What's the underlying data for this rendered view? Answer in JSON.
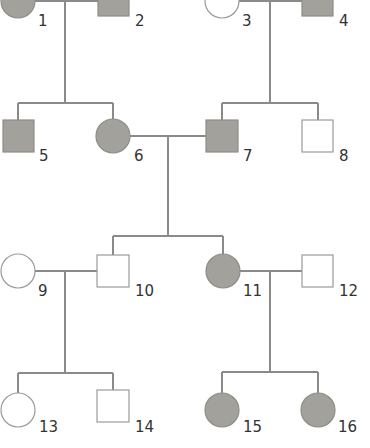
{
  "diagram": {
    "type": "pedigree",
    "colors": {
      "affected": "#a3a19b",
      "unaffected": "#ffffff",
      "line": "#8a8a8a",
      "label": "#333333"
    },
    "individuals": [
      {
        "id": "1",
        "label": "1",
        "sex": "female",
        "affected": true,
        "generation": 1
      },
      {
        "id": "2",
        "label": "2",
        "sex": "male",
        "affected": true,
        "generation": 1
      },
      {
        "id": "3",
        "label": "3",
        "sex": "female",
        "affected": false,
        "generation": 1
      },
      {
        "id": "4",
        "label": "4",
        "sex": "male",
        "affected": true,
        "generation": 1
      },
      {
        "id": "5",
        "label": "5",
        "sex": "male",
        "affected": true,
        "generation": 2
      },
      {
        "id": "6",
        "label": "6",
        "sex": "female",
        "affected": true,
        "generation": 2
      },
      {
        "id": "7",
        "label": "7",
        "sex": "male",
        "affected": true,
        "generation": 2
      },
      {
        "id": "8",
        "label": "8",
        "sex": "male",
        "affected": false,
        "generation": 2
      },
      {
        "id": "9",
        "label": "9",
        "sex": "female",
        "affected": false,
        "generation": 3
      },
      {
        "id": "10",
        "label": "10",
        "sex": "male",
        "affected": false,
        "generation": 3
      },
      {
        "id": "11",
        "label": "11",
        "sex": "female",
        "affected": true,
        "generation": 3
      },
      {
        "id": "12",
        "label": "12",
        "sex": "male",
        "affected": false,
        "generation": 3
      },
      {
        "id": "13",
        "label": "13",
        "sex": "female",
        "affected": false,
        "generation": 4
      },
      {
        "id": "14",
        "label": "14",
        "sex": "male",
        "affected": false,
        "generation": 4
      },
      {
        "id": "15",
        "label": "15",
        "sex": "female",
        "affected": true,
        "generation": 4
      },
      {
        "id": "16",
        "label": "16",
        "sex": "female",
        "affected": true,
        "generation": 4
      }
    ],
    "matings": [
      {
        "parents": [
          "1",
          "2"
        ],
        "children": [
          "5",
          "6"
        ]
      },
      {
        "parents": [
          "3",
          "4"
        ],
        "children": [
          "7",
          "8"
        ]
      },
      {
        "parents": [
          "6",
          "7"
        ],
        "children": [
          "10",
          "11"
        ]
      },
      {
        "parents": [
          "9",
          "10"
        ],
        "children": [
          "13",
          "14"
        ]
      },
      {
        "parents": [
          "11",
          "12"
        ],
        "children": [
          "15",
          "16"
        ]
      }
    ]
  }
}
